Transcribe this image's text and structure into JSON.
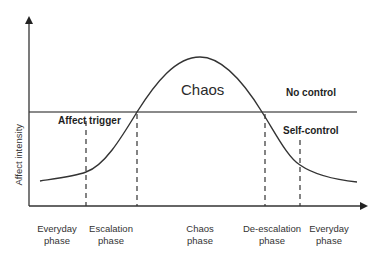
{
  "diagram": {
    "type": "affect-intensity-curve",
    "y_axis_label": "Affect intensity",
    "region_labels": {
      "chaos": "Chaos",
      "no_control": "No control",
      "affect_trigger": "Affect trigger",
      "self_control": "Self-control"
    },
    "phases": [
      {
        "line1": "Everyday",
        "line2": "phase"
      },
      {
        "line1": "Escalation",
        "line2": "phase"
      },
      {
        "line1": "Chaos",
        "line2": "phase"
      },
      {
        "line1": "De-escalation",
        "line2": "phase"
      },
      {
        "line1": "Everyday",
        "line2": "phase"
      }
    ],
    "colors": {
      "axis": "#333333",
      "curve": "#333333",
      "threshold_line": "#8a8a8a",
      "dashed_lines": "#333333",
      "text": "#222222"
    }
  }
}
